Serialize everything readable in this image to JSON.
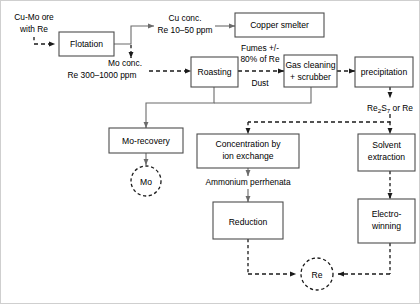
{
  "diagram": {
    "colors": {
      "box_stroke": "#4d4d4d",
      "solid_line": "#6b6b6b",
      "dashed_line": "#1a1a1a",
      "background": "#ffffff",
      "text": "#000000"
    },
    "boxes": [
      {
        "id": "flotation",
        "label": "Flotation"
      },
      {
        "id": "copper_smelter",
        "label": "Copper smelter"
      },
      {
        "id": "roasting",
        "label": "Roasting"
      },
      {
        "id": "gas_cleaning",
        "label_line1": "Gas cleaning",
        "label_line2": "+ scrubber"
      },
      {
        "id": "precipitation",
        "label": "precipitation"
      },
      {
        "id": "mo_recovery",
        "label": "Mo-recovery"
      },
      {
        "id": "concentration",
        "label_line1": "Concentration by",
        "label_line2": "ion exchange"
      },
      {
        "id": "solvent_extraction",
        "label_line1": "Solvent",
        "label_line2": "extraction"
      },
      {
        "id": "reduction",
        "label": "Reduction"
      },
      {
        "id": "electrowinning",
        "label_line1": "Electro-",
        "label_line2": "winning"
      }
    ],
    "nodes": [
      {
        "id": "mo_product",
        "label": "Mo"
      },
      {
        "id": "re_product",
        "label": "Re"
      }
    ],
    "labels": {
      "feed_line1": "Cu-Mo ore",
      "feed_line2": "with Re",
      "cu_conc_line1": "Cu conc.",
      "cu_conc_line2": "Re 10–50 ppm",
      "mo_conc_line1": "Mo conc.",
      "mo_conc_line2": "Re 300–1000 ppm",
      "fumes_line1": "Fumes +/-",
      "fumes_line2": "80% of Re",
      "dust": "Dust",
      "re2s7_pre": "Re",
      "re2s7_sub1": "2",
      "re2s7_mid": "S",
      "re2s7_sub2": "7",
      "re2s7_post": " or Re",
      "ammonium": "Ammonium perrhenata"
    }
  }
}
